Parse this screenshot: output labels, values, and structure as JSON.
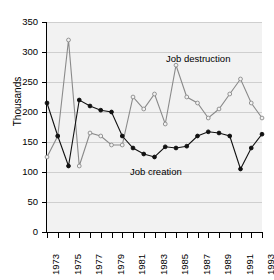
{
  "chart_data": {
    "type": "line",
    "title": "",
    "xlabel": "",
    "ylabel": "Thousands",
    "xlim": [
      1973,
      1993
    ],
    "ylim": [
      0,
      350
    ],
    "ytick_labels": [
      "350",
      "300",
      "250",
      "200",
      "150",
      "100",
      "50",
      "0"
    ],
    "ytick_values": [
      350,
      300,
      250,
      200,
      150,
      100,
      50,
      0
    ],
    "grid": true,
    "legend_position": "inline-annotations",
    "x": [
      1973,
      1974,
      1975,
      1976,
      1977,
      1978,
      1979,
      1980,
      1981,
      1982,
      1983,
      1984,
      1985,
      1986,
      1987,
      1988,
      1989,
      1990,
      1991,
      1992,
      1993
    ],
    "xtick_labels": [
      "1973",
      "",
      "1975",
      "",
      "1977",
      "",
      "1979",
      "",
      "1981",
      "",
      "1983",
      "",
      "1985",
      "",
      "1987",
      "",
      "1989",
      "",
      "1991",
      "",
      "1993"
    ],
    "series": [
      {
        "name": "Job destruction",
        "color": "#8a8a8a",
        "marker": "open-circle",
        "values": [
          125,
          160,
          320,
          110,
          165,
          160,
          145,
          145,
          225,
          205,
          230,
          180,
          278,
          225,
          215,
          190,
          205,
          230,
          255,
          215,
          190
        ]
      },
      {
        "name": "Job creation",
        "color": "#111111",
        "marker": "filled-circle",
        "values": [
          215,
          160,
          110,
          220,
          210,
          203,
          200,
          160,
          140,
          130,
          125,
          142,
          140,
          143,
          160,
          167,
          165,
          160,
          105,
          140,
          163
        ]
      }
    ],
    "annotations": [
      {
        "text": "Job destruction",
        "series": "Job destruction"
      },
      {
        "text": "Job creation",
        "series": "Job creation"
      }
    ]
  }
}
